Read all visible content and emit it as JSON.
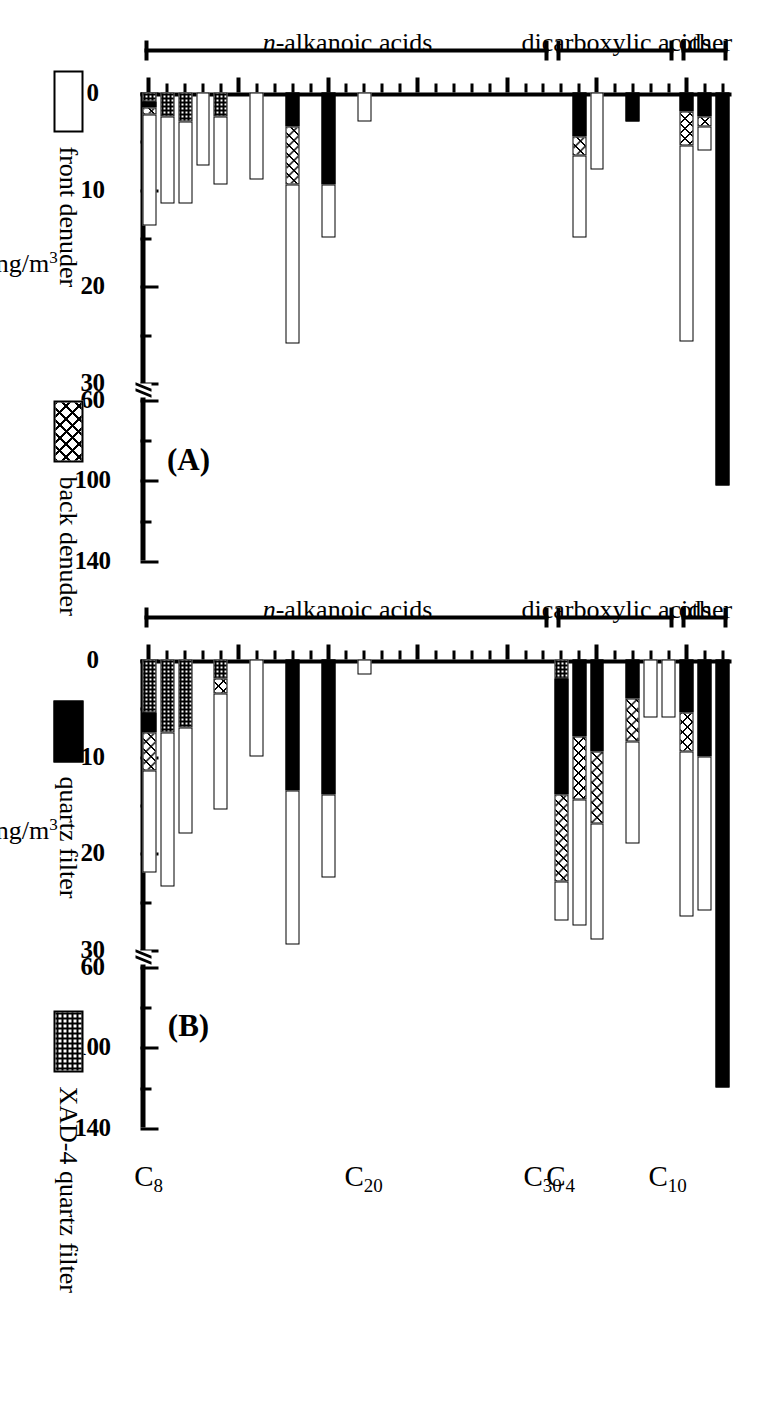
{
  "figure": {
    "orientation_note": "rotated",
    "axis_title": "ng/m3",
    "axis_title_html": "ng/m³"
  },
  "panels": [
    {
      "tag": "(A)",
      "ylabel": "ng/m³"
    },
    {
      "tag": "(B)",
      "ylabel": "ng/m³"
    }
  ],
  "groups": [
    {
      "label": "n-alkanoic acids",
      "italic_prefix": "n"
    },
    {
      "label": "dicarboxylic acids",
      "italic_prefix": ""
    },
    {
      "label": "other",
      "italic_prefix": ""
    }
  ],
  "carbon_labels": [
    "C8",
    "C20",
    "C30",
    "C4",
    "C10"
  ],
  "carbon_labels_html": [
    "C<sub>8</sub>",
    "C<sub>20</sub>",
    "C<sub>30</sub>",
    "C<sub>4</sub>",
    "C<sub>10</sub>"
  ],
  "legend": {
    "entries": [
      {
        "label": "front denuder",
        "pattern": "front"
      },
      {
        "label": "back denuder",
        "pattern": "xhatch"
      },
      {
        "label": "quartz filter",
        "pattern": "black"
      },
      {
        "label": "XAD-4 quartz filter",
        "pattern": "check"
      }
    ]
  },
  "axis": {
    "lower_ticks": [
      0,
      10,
      20,
      30
    ],
    "upper_ticks": [
      60,
      100,
      140
    ],
    "lower_ticks_labels": [
      "0",
      "10",
      "20",
      "30"
    ],
    "upper_ticks_labels": [
      "60",
      "100",
      "140"
    ],
    "break_between": [
      30,
      60
    ],
    "unit": "ng/m3"
  },
  "chart_data": {
    "type": "bar",
    "title": "",
    "subtitle": "",
    "xlabel": "",
    "ylabel": "ng/m³",
    "orientation": "horizontal",
    "stacked": true,
    "grid": false,
    "legend_position": "bottom",
    "broken_axis": {
      "lower": [
        0,
        30
      ],
      "upper": [
        60,
        140
      ]
    },
    "series_names": [
      "front denuder",
      "back denuder",
      "quartz filter",
      "XAD-4 quartz filter"
    ],
    "categories": [
      "C8",
      "C9",
      "C10",
      "C11",
      "C12",
      "C13",
      "C14",
      "C15",
      "C16",
      "C17",
      "C18",
      "C19",
      "C20",
      "C21",
      "C22",
      "C23",
      "C24",
      "C25",
      "C26",
      "C27",
      "C28",
      "C29",
      "C30",
      "C4",
      "C5",
      "C6",
      "C7",
      "C8d",
      "C9d",
      "C10d",
      "o1",
      "o2",
      "o3"
    ],
    "category_groups": [
      {
        "name": "n-alkanoic acids",
        "from": "C8",
        "to": "C30"
      },
      {
        "name": "dicarboxylic acids",
        "from": "C4",
        "to": "C10d"
      },
      {
        "name": "other",
        "from": "o1",
        "to": "o3"
      }
    ],
    "panels": [
      {
        "tag": "(A)",
        "series": [
          {
            "name": "front denuder",
            "values": [
              11.5,
              9.0,
              8.5,
              7.5,
              7.0,
              0,
              9.0,
              0,
              16.5,
              0,
              5.5,
              0,
              3.0,
              0,
              0,
              0,
              0,
              0,
              0,
              0,
              0,
              0,
              0,
              0,
              8.5,
              8.0,
              0,
              0,
              0,
              0,
              26.0,
              2.5,
              0
            ]
          },
          {
            "name": "back denuder",
            "values": [
              0.8,
              0,
              0,
              0,
              0,
              0,
              0,
              0,
              6.0,
              0,
              0,
              0,
              0,
              0,
              0,
              0,
              0,
              0,
              0,
              0,
              0,
              0,
              0,
              0,
              2.0,
              0,
              0,
              0,
              0,
              0,
              3.5,
              1.0,
              0
            ]
          },
          {
            "name": "quartz filter",
            "values": [
              0.6,
              0,
              0,
              0,
              0,
              0,
              0,
              0,
              3.5,
              0,
              9.5,
              0,
              0,
              0,
              0,
              0,
              0,
              0,
              0,
              0,
              0,
              0,
              0,
              0,
              4.5,
              0,
              0,
              3.0,
              0,
              0,
              2.0,
              2.5,
              103.0
            ]
          },
          {
            "name": "XAD-4 quartz filter",
            "values": [
              0.9,
              2.5,
              3.0,
              0,
              2.5,
              0,
              0,
              0,
              0,
              0,
              0,
              0,
              0,
              0,
              0,
              0,
              0,
              0,
              0,
              0,
              0,
              0,
              0,
              0,
              0,
              0,
              0,
              0,
              0,
              0,
              0,
              0,
              0
            ]
          }
        ]
      },
      {
        "tag": "(B)",
        "series": [
          {
            "name": "front denuder",
            "values": [
              10.5,
              16.0,
              11.0,
              0,
              12.0,
              0,
              10.0,
              0,
              16.0,
              0,
              8.5,
              0,
              1.5,
              0,
              0,
              0,
              0,
              0,
              0,
              0,
              0,
              0,
              0,
              4.0,
              13.0,
              12.0,
              0,
              10.5,
              6.0,
              6.0,
              26.0,
              16.0,
              0
            ]
          },
          {
            "name": "back denuder",
            "values": [
              4.0,
              0,
              0,
              0,
              1.5,
              0,
              0,
              0,
              0,
              0,
              0,
              0,
              0,
              0,
              0,
              0,
              0,
              0,
              0,
              0,
              0,
              0,
              0,
              9.0,
              6.5,
              7.5,
              0,
              4.5,
              0,
              0,
              4.0,
              0,
              0
            ]
          },
          {
            "name": "quartz filter",
            "values": [
              2.0,
              0,
              0,
              0,
              0,
              0,
              0,
              0,
              13.5,
              0,
              14.0,
              0,
              0,
              0,
              0,
              0,
              0,
              0,
              0,
              0,
              0,
              0,
              0,
              12.0,
              8.0,
              9.5,
              0,
              4.0,
              0,
              0,
              5.5,
              10.0,
              120.0
            ]
          },
          {
            "name": "XAD-4 quartz filter",
            "values": [
              5.5,
              7.5,
              7.0,
              0,
              2.0,
              0,
              0,
              0,
              0,
              0,
              0,
              0,
              0,
              0,
              0,
              0,
              0,
              0,
              0,
              0,
              0,
              0,
              0,
              2.0,
              0,
              0,
              0,
              0,
              0,
              0,
              0,
              0,
              0
            ]
          }
        ]
      }
    ]
  }
}
